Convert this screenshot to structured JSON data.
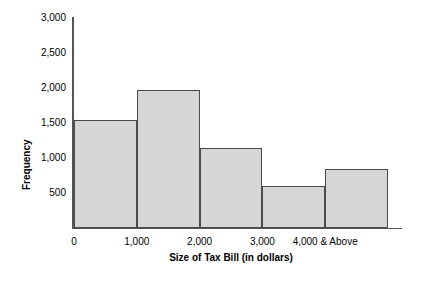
{
  "chart_data": {
    "type": "bar",
    "title": "",
    "xlabel": "Size of Tax Bill (in dollars)",
    "ylabel": "Frequency",
    "categories": [
      "0 - 1,000",
      "1,000 - 2,000",
      "2,000 - 3,000",
      "3,000 - 4,000",
      "4,000 & Above"
    ],
    "values": [
      1550,
      1975,
      1150,
      600,
      850
    ],
    "bin_edges": [
      0,
      1000,
      2000,
      3000,
      4000,
      5000
    ],
    "xtick_labels": [
      "0",
      "1,000",
      "2,000",
      "3,000",
      "4,000 & Above"
    ],
    "xtick_values": [
      0,
      1000,
      2000,
      3000,
      4000
    ],
    "ytick_labels": [
      "3,000",
      "2,500",
      "2,000",
      "1,500",
      "1,000",
      "500"
    ],
    "ytick_values": [
      3000,
      2500,
      2000,
      1500,
      1000,
      500
    ],
    "ylim": [
      0,
      3000
    ],
    "xlim": [
      0,
      5000
    ],
    "grid": false,
    "legend": false,
    "bar_fill_color": "#d6d6d6",
    "bar_edge_color": "#4a4a4a",
    "axis_color": "#555555",
    "background_color": "#ffffff"
  }
}
